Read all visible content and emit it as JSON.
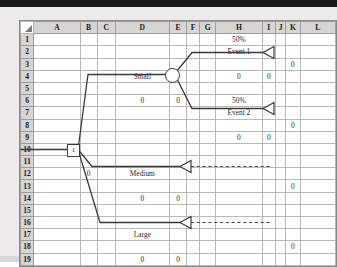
{
  "app": {
    "type": "spreadsheet-decision-tree",
    "select_all_icon": "select-all-corner-icon"
  },
  "grid": {
    "columns": [
      "A",
      "B",
      "C",
      "D",
      "E",
      "F",
      "G",
      "H",
      "I",
      "J",
      "K",
      "L"
    ],
    "rows": [
      "1",
      "2",
      "3",
      "4",
      "5",
      "6",
      "7",
      "8",
      "9",
      "10",
      "11",
      "12",
      "13",
      "14",
      "15",
      "16",
      "17",
      "18",
      "19"
    ]
  },
  "cells": {
    "H1": "50%",
    "H2": "Event 1",
    "K3": "0",
    "D4": "Small",
    "H4": "0",
    "I4": "0",
    "D6": "0",
    "E6": "0",
    "H6": "50%",
    "H7": "Event 2",
    "K8": "0",
    "H9": "0",
    "I9": "0",
    "C11": "1",
    "B12": "0",
    "D12": "Medium",
    "K13": "0",
    "D14": "0",
    "E14": "0",
    "D17": "Large",
    "K18": "0",
    "D19": "0",
    "E19": "0"
  },
  "tree": {
    "decision_node": {
      "name": "decision-node",
      "value": "1",
      "cell": "C11"
    },
    "chance_node": {
      "name": "chance-node",
      "cell": "F5"
    },
    "branches": [
      {
        "label": "Small",
        "label_cell": "D4",
        "payoff": "0",
        "probability_cell": "D6"
      },
      {
        "label": "Medium",
        "label_cell": "D12",
        "payoff": "0",
        "probability_cell": "D14"
      },
      {
        "label": "Large",
        "label_cell": "D17",
        "payoff": "0",
        "probability_cell": "D19"
      }
    ],
    "events": [
      {
        "label": "Event 1",
        "probability": "50%",
        "payoff": "0",
        "endpoint_value": "0"
      },
      {
        "label": "Event 2",
        "probability": "50%",
        "payoff": "0",
        "endpoint_value": "0"
      }
    ],
    "endpoints": [
      {
        "name": "endpoint-event-1",
        "value": "0",
        "cell": "K3"
      },
      {
        "name": "endpoint-event-2",
        "value": "0",
        "cell": "K8"
      },
      {
        "name": "endpoint-medium",
        "value": "0",
        "cell": "K13"
      },
      {
        "name": "endpoint-large",
        "value": "0",
        "cell": "K18"
      }
    ]
  },
  "colors": {
    "line": "#3a3a3a",
    "grid_line": "#b9b9b9",
    "header_bg": "#d7d5d3",
    "page_bg": "#eceaea",
    "sheet_bg": "#ffffff"
  }
}
